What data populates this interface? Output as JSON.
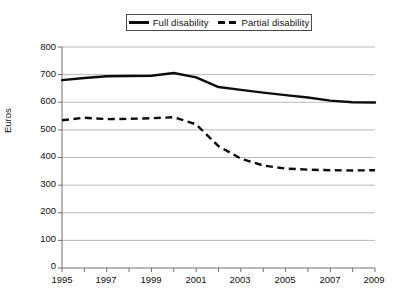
{
  "chart_data": {
    "type": "line",
    "title": "",
    "xlabel": "",
    "ylabel": "Euros",
    "xlim": [
      1995,
      2009
    ],
    "ylim": [
      0,
      800
    ],
    "grid": true,
    "legend_position": "top-center",
    "x": [
      1995,
      1996,
      1997,
      1998,
      1999,
      2000,
      2001,
      2002,
      2003,
      2004,
      2005,
      2006,
      2007,
      2008,
      2009
    ],
    "xtick_labels": [
      "1995",
      "1997",
      "1999",
      "2001",
      "2003",
      "2005",
      "2007",
      "2009"
    ],
    "xtick_values": [
      1995,
      1997,
      1999,
      2001,
      2003,
      2005,
      2007,
      2009
    ],
    "ytick_labels": [
      "0",
      "100",
      "200",
      "300",
      "400",
      "500",
      "600",
      "700",
      "800"
    ],
    "ytick_values": [
      0,
      100,
      200,
      300,
      400,
      500,
      600,
      700,
      800
    ],
    "series": [
      {
        "name": "Full disability",
        "style": "solid",
        "color": "#0d0d0d",
        "values": [
          680,
          688,
          694,
          695,
          696,
          706,
          690,
          655,
          645,
          635,
          626,
          617,
          606,
          600,
          599
        ]
      },
      {
        "name": "Partial disability",
        "style": "dashed",
        "color": "#0d0d0d",
        "values": [
          535,
          544,
          539,
          540,
          542,
          546,
          520,
          441,
          396,
          371,
          360,
          356,
          354,
          353,
          354
        ]
      }
    ]
  },
  "legend": {
    "entries": [
      {
        "label": "Full disability",
        "style": "solid"
      },
      {
        "label": "Partial disability",
        "style": "dashed"
      }
    ]
  },
  "axes": {
    "y_axis_title": "Euros"
  }
}
